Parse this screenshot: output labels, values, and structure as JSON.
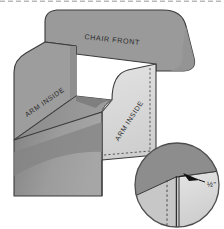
{
  "figure": {
    "title_label": "CHAIR FRONT",
    "arm_left_label": "ARM INSIDE",
    "arm_right_label": "ARM INSIDE",
    "detail_dimension": "½\"",
    "caption": "",
    "colors": {
      "chair_front": "#9a9a9a",
      "arm_left": "#9d9d9d",
      "arm_right": "#d8d8d8",
      "seat_floor": "#8e8e8e",
      "shadow": "#7f7f7f",
      "front_bottom": "#a2a2a2",
      "outline": "#3b3b3b",
      "stitch": "#4a4a4a",
      "detail_top": "#8d8d8d",
      "detail_light": "#dcdcdc",
      "detail_mid": "#c9c9c9",
      "arrow": "#111111",
      "page": "#ffffff"
    }
  }
}
